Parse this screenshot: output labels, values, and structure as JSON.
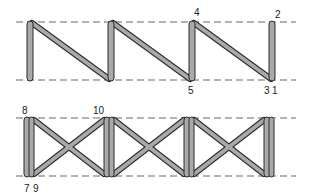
{
  "colors": {
    "bar_fill": "#a9a9a9",
    "bar_stroke": "#2a2a2a",
    "dash": "#666666",
    "label": "#222222"
  },
  "top_panel": {
    "name": "zigzag-stitch-pattern",
    "labels": [
      {
        "text": "4",
        "x": 194,
        "y": 16
      },
      {
        "text": "2",
        "x": 275,
        "y": 18
      },
      {
        "text": "5",
        "x": 188,
        "y": 94
      },
      {
        "text": "3",
        "x": 264,
        "y": 94
      },
      {
        "text": "1",
        "x": 272,
        "y": 94
      }
    ]
  },
  "bottom_panel": {
    "name": "cross-stitch-pattern",
    "labels": [
      {
        "text": "8",
        "x": 22,
        "y": 114
      },
      {
        "text": "10",
        "x": 93,
        "y": 114
      },
      {
        "text": "7",
        "x": 24,
        "y": 192
      },
      {
        "text": "9",
        "x": 33,
        "y": 192
      }
    ]
  }
}
